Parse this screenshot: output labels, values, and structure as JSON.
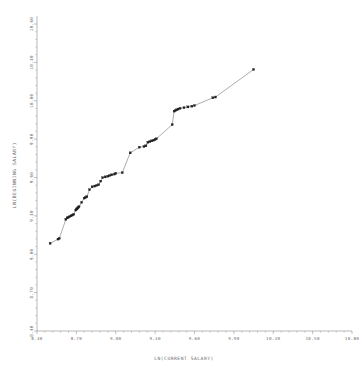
{
  "chart_data": {
    "type": "scatter",
    "title": "",
    "xlabel": "LN(CURRENT SALARY)",
    "ylabel": "LN(BEGINNING SALARY)",
    "xlim": [
      8.4,
      10.8
    ],
    "ylim": [
      8.4,
      10.6
    ],
    "xticks": [
      "8.40",
      "8.70",
      "9.00",
      "9.30",
      "9.60",
      "9.90",
      "10.20",
      "10.50",
      "10.80"
    ],
    "xtick_values": [
      8.4,
      8.7,
      9.0,
      9.3,
      9.6,
      9.9,
      10.2,
      10.5,
      10.8
    ],
    "yticks": [
      "8.40",
      "8.70",
      "9.00",
      "9.30",
      "9.60",
      "9.90",
      "10.00",
      "10.30",
      "10.60"
    ],
    "ytick_values": [
      8.4,
      8.7,
      9.0,
      9.3,
      9.6,
      9.9,
      10.0,
      10.3,
      10.6
    ],
    "grid": false,
    "legend": null,
    "marker_style": "filled-square",
    "line_style": "solid-thin",
    "x": [
      8.5,
      8.56,
      8.57,
      8.62,
      8.63,
      8.64,
      8.65,
      8.66,
      8.67,
      8.68,
      8.695,
      8.7,
      8.705,
      8.71,
      8.715,
      8.72,
      8.74,
      8.76,
      8.77,
      8.78,
      8.8,
      8.82,
      8.84,
      8.855,
      8.87,
      8.885,
      8.9,
      8.92,
      8.94,
      8.955,
      8.97,
      8.99,
      9.0,
      9.05,
      9.11,
      9.18,
      9.215,
      9.23,
      9.245,
      9.26,
      9.275,
      9.29,
      9.3,
      9.31,
      9.43,
      9.445,
      9.455,
      9.465,
      9.475,
      9.49,
      9.52,
      9.55,
      9.58,
      9.6,
      9.74,
      9.76,
      10.05
    ],
    "y": [
      9.02,
      9.05,
      9.055,
      9.19,
      9.2,
      9.205,
      9.21,
      9.215,
      9.22,
      9.225,
      9.255,
      9.26,
      9.265,
      9.27,
      9.275,
      9.28,
      9.31,
      9.34,
      9.345,
      9.35,
      9.4,
      9.42,
      9.425,
      9.43,
      9.435,
      9.46,
      9.485,
      9.49,
      9.495,
      9.5,
      9.505,
      9.51,
      9.515,
      9.52,
      9.66,
      9.7,
      9.705,
      9.71,
      9.735,
      9.74,
      9.745,
      9.75,
      9.755,
      9.76,
      9.86,
      9.955,
      9.96,
      9.965,
      9.97,
      9.975,
      9.98,
      9.985,
      9.99,
      9.995,
      10.05,
      10.055,
      10.25
    ]
  },
  "axes": {
    "x_axis_name": "x-axis",
    "y_axis_name": "y-axis"
  }
}
